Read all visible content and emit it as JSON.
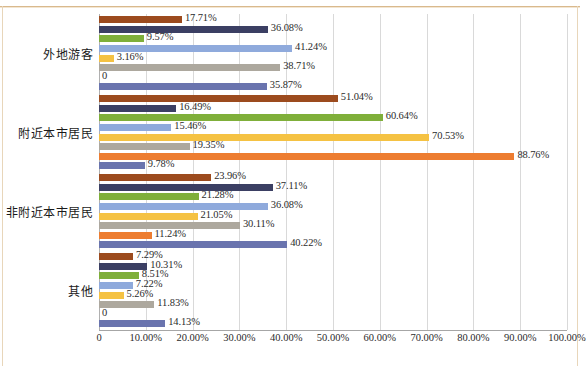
{
  "chart_data": {
    "type": "bar",
    "orientation": "horizontal",
    "title": "",
    "xlabel": "",
    "ylabel": "",
    "xlim": [
      0,
      100
    ],
    "grid": true,
    "legend": "none",
    "value_suffix": "%",
    "xticks": [
      "0",
      "10.00%",
      "20.00%",
      "30.00%",
      "40.00%",
      "50.00%",
      "60.00%",
      "70.00%",
      "80.00%",
      "90.00%",
      "100.00%"
    ],
    "xtick_values": [
      0,
      10,
      20,
      30,
      40,
      50,
      60,
      70,
      80,
      90,
      100
    ],
    "categories": [
      "外地游客",
      "附近本市居民",
      "非附近本市居民",
      "其他"
    ],
    "series": [
      {
        "name": "series-1",
        "color": "#9C4B1E",
        "values": [
          17.71,
          51.04,
          23.96,
          7.29
        ],
        "labels": [
          "17.71%",
          "51.04%",
          "23.96%",
          "7.29%"
        ]
      },
      {
        "name": "series-2",
        "color": "#3B3F63",
        "values": [
          36.08,
          16.49,
          37.11,
          10.31
        ],
        "labels": [
          "36.08%",
          "16.49%",
          "37.11%",
          "10.31%"
        ]
      },
      {
        "name": "series-3",
        "color": "#7FAF3A",
        "values": [
          9.57,
          60.64,
          21.28,
          8.51
        ],
        "labels": [
          "9.57%",
          "60.64%",
          "21.28%",
          "8.51%"
        ]
      },
      {
        "name": "series-4",
        "color": "#8FAADC",
        "values": [
          41.24,
          15.46,
          36.08,
          7.22
        ],
        "labels": [
          "41.24%",
          "15.46%",
          "36.08%",
          "7.22%"
        ]
      },
      {
        "name": "series-5",
        "color": "#F5C243",
        "values": [
          3.16,
          70.53,
          21.05,
          5.26
        ],
        "labels": [
          "3.16%",
          "70.53%",
          "21.05%",
          "5.26%"
        ]
      },
      {
        "name": "series-6",
        "color": "#ADA89E",
        "values": [
          38.71,
          19.35,
          30.11,
          11.83
        ],
        "labels": [
          "38.71%",
          "19.35%",
          "30.11%",
          "11.83%"
        ]
      },
      {
        "name": "series-7",
        "color": "#ED7D31",
        "values": [
          0,
          88.76,
          11.24,
          0
        ],
        "labels": [
          "0",
          "88.76%",
          "11.24%",
          "0"
        ]
      },
      {
        "name": "series-8",
        "color": "#6A74AE",
        "values": [
          35.87,
          9.78,
          40.22,
          14.13
        ],
        "labels": [
          "35.87%",
          "9.78%",
          "40.22%",
          "14.13%"
        ]
      }
    ]
  }
}
